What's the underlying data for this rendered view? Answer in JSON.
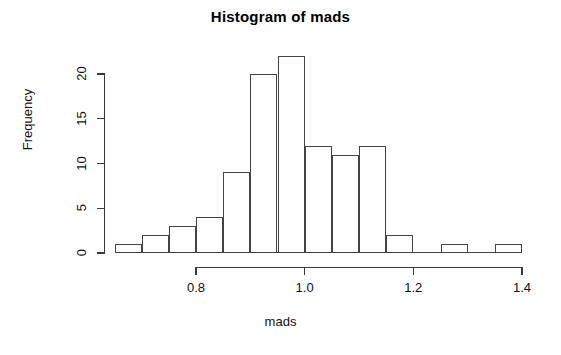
{
  "chart_data": {
    "type": "bar",
    "title": "Histogram of mads",
    "xlabel": "mads",
    "ylabel": "Frequency",
    "subtitle": "",
    "grid": false,
    "legend": false,
    "legend_position": "none",
    "bin_width": 0.05,
    "bin_edges": [
      0.65,
      0.7,
      0.75,
      0.8,
      0.85,
      0.9,
      0.95,
      1.0,
      1.05,
      1.1,
      1.15,
      1.2,
      1.25,
      1.3,
      1.35,
      1.4
    ],
    "categories": [
      "0.65-0.70",
      "0.70-0.75",
      "0.75-0.80",
      "0.80-0.85",
      "0.85-0.90",
      "0.90-0.95",
      "0.95-1.00",
      "1.00-1.05",
      "1.05-1.10",
      "1.10-1.15",
      "1.15-1.20",
      "1.20-1.25",
      "1.25-1.30",
      "1.30-1.35",
      "1.35-1.40"
    ],
    "values": [
      1,
      2,
      3,
      4,
      9,
      20,
      22,
      12,
      11,
      12,
      2,
      0,
      1,
      0,
      1
    ],
    "xlim": [
      0.65,
      1.4
    ],
    "ylim": [
      0,
      22
    ],
    "x_ticks": [
      0.8,
      1.0,
      1.2,
      1.4
    ],
    "x_tick_labels": [
      "0.8",
      "1.0",
      "1.2",
      "1.4"
    ],
    "y_ticks": [
      0,
      5,
      10,
      15,
      20
    ],
    "y_tick_labels": [
      "0",
      "5",
      "10",
      "15",
      "20"
    ],
    "bar_fill_color": "#ffffff",
    "bar_border_color": "#444444",
    "axis_color": "#3a3a3a",
    "text_color": "#111111",
    "background_color": "#ffffff"
  }
}
